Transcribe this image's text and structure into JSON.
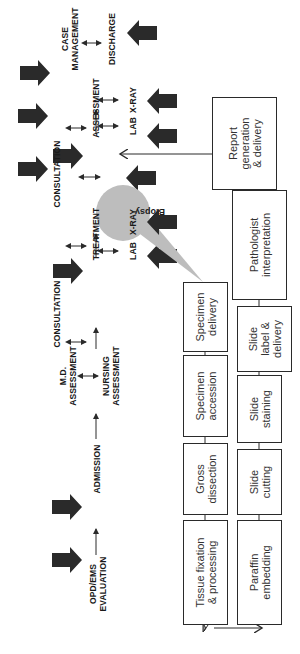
{
  "diagram": {
    "orientation": "rotated 90 degrees counter-clockwise",
    "hospital_flow": {
      "steps": [
        {
          "id": "opd",
          "label": "OPD/EMS\nEVALUATION"
        },
        {
          "id": "admission",
          "label": "ADMISSION"
        },
        {
          "id": "md_assessment",
          "label": "M.D.\nASSESSMENT"
        },
        {
          "id": "nursing_assessment",
          "label": "NURSING\nASSESSMENT"
        },
        {
          "id": "consultation1",
          "label": "CONSULTATION"
        },
        {
          "id": "lab1",
          "label": "LAB"
        },
        {
          "id": "xray1",
          "label": "X-RAY"
        },
        {
          "id": "treatment",
          "label": "TREATMENT"
        },
        {
          "id": "consultation2",
          "label": "CONSULTATION"
        },
        {
          "id": "lab2",
          "label": "LAB"
        },
        {
          "id": "xray2",
          "label": "X-RAY"
        },
        {
          "id": "assessment",
          "label": "ASSESSMENT"
        },
        {
          "id": "case_management",
          "label": "CASE\nMANAGEMENT"
        },
        {
          "id": "discharge",
          "label": "DISCHARGE"
        }
      ],
      "callout": "Biopsy"
    },
    "pathology_flow": {
      "top_row": [
        {
          "id": "tissue_fixation",
          "label": "Tissue fixation\n& processing"
        },
        {
          "id": "gross_dissection",
          "label": "Gross\ndissection"
        },
        {
          "id": "specimen_accession",
          "label": "Specimen\naccession"
        },
        {
          "id": "specimen_delivery",
          "label": "Specimen\ndelivery"
        }
      ],
      "bottom_row": [
        {
          "id": "paraffin_embedding",
          "label": "Paraffin\nembedding"
        },
        {
          "id": "slide_cutting",
          "label": "Slide\ncutting"
        },
        {
          "id": "slide_staining",
          "label": "Slide\nstaining"
        },
        {
          "id": "slide_label",
          "label": "Slide\nlabel &\ndelivery"
        },
        {
          "id": "pathologist",
          "label": "Pathologist\ninterpretation"
        },
        {
          "id": "report",
          "label": "Report\ngeneration\n& delivery"
        }
      ]
    },
    "colors": {
      "arrow": "#2a2a2a",
      "callout": "#bdbdbd",
      "box_border": "#2a2a2a"
    }
  }
}
